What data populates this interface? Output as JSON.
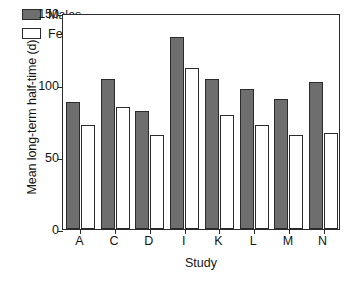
{
  "chart_data": {
    "type": "bar",
    "title": "",
    "subtitle": "",
    "xlabel": "Study",
    "ylabel": "Mean long-term half-time (d)",
    "categories": [
      "A",
      "C",
      "D",
      "I",
      "K",
      "L",
      "M",
      "N"
    ],
    "series": [
      {
        "name": "Males",
        "values": [
          88,
          104,
          82,
          133,
          104,
          97,
          90,
          102
        ],
        "color": "#6e6e6e"
      },
      {
        "name": "Females",
        "values": [
          72,
          85,
          65,
          112,
          79,
          72,
          65,
          67
        ],
        "color": "#ffffff"
      }
    ],
    "ylim": [
      0,
      150
    ],
    "yticks": [
      0,
      50,
      100,
      150
    ],
    "ytick_labels": [
      "0",
      "50",
      "100",
      "150"
    ],
    "grid": false,
    "legend_position": "top-left",
    "legend_entries": [
      "Males",
      "Females"
    ],
    "axis_color": "#2b2b2b",
    "background": "#ffffff"
  }
}
